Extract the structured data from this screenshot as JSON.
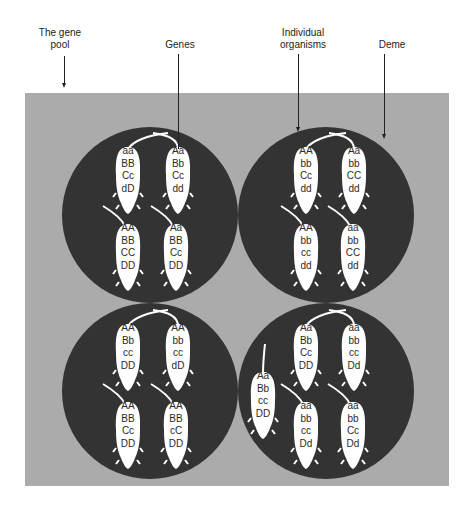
{
  "labels": {
    "gene_pool": [
      "The gene",
      "pool"
    ],
    "genes": "Genes",
    "individual_organisms": [
      "Individual",
      "organisms"
    ],
    "deme": "Deme"
  },
  "colors": {
    "gene_pool_background": "#ababab",
    "deme_fill": "#333333",
    "organism_fill": "#ffffff",
    "text": "#222222"
  },
  "demes": [
    {
      "position": "top-left",
      "organisms": [
        {
          "genotype": [
            "aa",
            "BB",
            "Cc",
            "dD"
          ]
        },
        {
          "genotype": [
            "Aa",
            "Bb",
            "Cc",
            "dd"
          ]
        },
        {
          "genotype": [
            "AA",
            "BB",
            "CC",
            "DD"
          ]
        },
        {
          "genotype": [
            "Aa",
            "BB",
            "Cc",
            "DD"
          ]
        }
      ]
    },
    {
      "position": "top-right",
      "organisms": [
        {
          "genotype": [
            "AA",
            "bb",
            "Cc",
            "dd"
          ]
        },
        {
          "genotype": [
            "Aa",
            "bb",
            "CC",
            "dd"
          ]
        },
        {
          "genotype": [
            "AA",
            "bb",
            "cc",
            "dd"
          ]
        },
        {
          "genotype": [
            "aa",
            "bb",
            "CC",
            "dd"
          ]
        }
      ]
    },
    {
      "position": "bottom-left",
      "organisms": [
        {
          "genotype": [
            "AA",
            "Bb",
            "cc",
            "DD"
          ]
        },
        {
          "genotype": [
            "AA",
            "bb",
            "cc",
            "dD"
          ]
        },
        {
          "genotype": [
            "AA",
            "BB",
            "Cc",
            "DD"
          ]
        },
        {
          "genotype": [
            "AA",
            "BB",
            "cC",
            "DD"
          ]
        }
      ]
    },
    {
      "position": "bottom-right",
      "organisms": [
        {
          "genotype": [
            "Aa",
            "Bb",
            "Cc",
            "DD"
          ]
        },
        {
          "genotype": [
            "aa",
            "bb",
            "cc",
            "Dd"
          ]
        },
        {
          "genotype": [
            "Aa",
            "Bb",
            "cc",
            "DD"
          ]
        },
        {
          "genotype": [
            "aa",
            "bb",
            "cc",
            "Dd"
          ]
        },
        {
          "genotype": [
            "aa",
            "bb",
            "Cc",
            "Dd"
          ]
        }
      ]
    }
  ]
}
